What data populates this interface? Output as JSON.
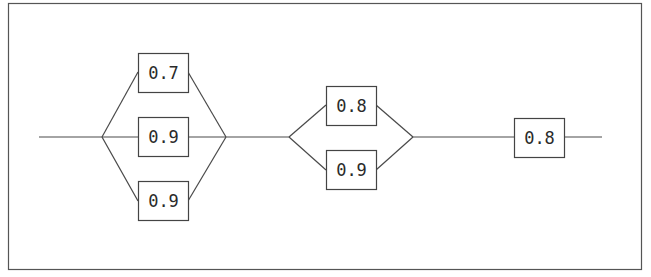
{
  "diagram": {
    "type": "reliability-block-diagram",
    "stages": [
      {
        "id": "stage-1",
        "kind": "parallel",
        "components": [
          {
            "id": "s1-c1",
            "reliability": "0.7"
          },
          {
            "id": "s1-c2",
            "reliability": "0.9"
          },
          {
            "id": "s1-c3",
            "reliability": "0.9"
          }
        ]
      },
      {
        "id": "stage-2",
        "kind": "parallel",
        "components": [
          {
            "id": "s2-c1",
            "reliability": "0.8"
          },
          {
            "id": "s2-c2",
            "reliability": "0.9"
          }
        ]
      },
      {
        "id": "stage-3",
        "kind": "single",
        "components": [
          {
            "id": "s3-c1",
            "reliability": "0.8"
          }
        ]
      }
    ],
    "colors": {
      "line": "#4a4a4a",
      "box_border": "#444444",
      "text": "#2a2a2a",
      "background": "#ffffff"
    }
  }
}
